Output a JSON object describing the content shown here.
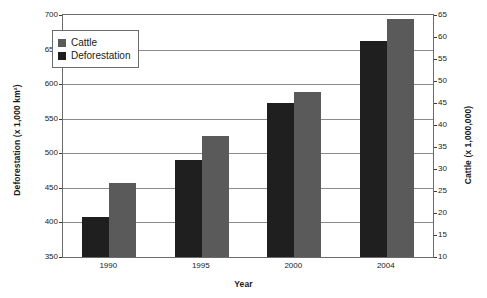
{
  "chart_data": {
    "type": "bar",
    "title": "",
    "xlabel": "Year",
    "categories": [
      "1990",
      "1995",
      "2000",
      "2004"
    ],
    "series": [
      {
        "name": "Deforestation",
        "axis": "left",
        "color": "#1f1f1f",
        "unit": "x 1,000 km2",
        "values": [
          408,
          490,
          573,
          663
        ]
      },
      {
        "name": "Cattle",
        "axis": "right",
        "color": "#5a5a5a",
        "unit": "x 1,000,000",
        "values": [
          26.8,
          37.5,
          47.4,
          64.0
        ]
      }
    ],
    "axes": {
      "left": {
        "label": "Deforestation (x 1,000 km²)",
        "ylim": [
          350,
          700
        ],
        "step": 50,
        "ticks": [
          "350",
          "400",
          "450",
          "500",
          "550",
          "600",
          "650",
          "700"
        ]
      },
      "right": {
        "label": "Cattle (x 1,000,000)",
        "ylim": [
          10,
          65
        ],
        "step": 5,
        "ticks": [
          "10",
          "15",
          "20",
          "25",
          "30",
          "35",
          "40",
          "45",
          "50",
          "55",
          "60",
          "65"
        ]
      }
    },
    "grid": true,
    "legend_position": "top-left"
  },
  "legend": {
    "items": [
      {
        "label": "Cattle",
        "color": "#5a5a5a"
      },
      {
        "label": "Deforestation",
        "color": "#1f1f1f"
      }
    ]
  }
}
